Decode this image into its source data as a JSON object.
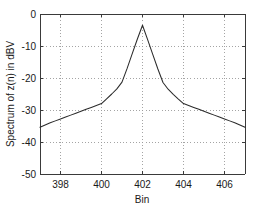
{
  "figure": {
    "background_color": "#ffffff",
    "axes_color": "#3a3a3a",
    "grid_color": "#9a9a9a",
    "curve_color": "#2b2b2b"
  },
  "chart_data": {
    "type": "line",
    "title": "",
    "xlabel": "Bin",
    "ylabel": "Spectrum of z(n) in dBV",
    "xlim": [
      397,
      407
    ],
    "ylim": [
      -50,
      0
    ],
    "xticks": [
      398,
      400,
      402,
      404,
      406
    ],
    "xtick_labels": [
      "398",
      "400",
      "402",
      "404",
      "406"
    ],
    "yticks": [
      0,
      -10,
      -20,
      -30,
      -40,
      -50
    ],
    "ytick_labels": [
      "0",
      "-10",
      "-20",
      "-30",
      "-40",
      "-50"
    ],
    "grid": true,
    "grid_style": "dotted",
    "legend": null,
    "series": [
      {
        "name": "Spectrum of z(n)",
        "x": [
          397.0,
          397.25,
          397.5,
          397.75,
          398.0,
          398.25,
          398.5,
          398.75,
          399.0,
          399.25,
          399.5,
          399.75,
          400.0,
          400.25,
          400.5,
          400.75,
          401.0,
          401.25,
          401.5,
          401.75,
          402.0,
          402.25,
          402.5,
          402.75,
          403.0,
          403.25,
          403.5,
          403.75,
          404.0,
          404.25,
          404.5,
          404.75,
          405.0,
          405.25,
          405.5,
          405.75,
          406.0,
          406.25,
          406.5,
          406.75,
          407.0
        ],
        "y": [
          -35.4,
          -34.7,
          -34.0,
          -33.4,
          -32.8,
          -32.2,
          -31.6,
          -31.0,
          -30.4,
          -29.8,
          -29.2,
          -28.6,
          -28.0,
          -26.5,
          -25.0,
          -23.4,
          -21.3,
          -17.0,
          -12.4,
          -7.8,
          -3.5,
          -8.0,
          -12.6,
          -17.2,
          -21.4,
          -23.5,
          -25.1,
          -26.6,
          -28.0,
          -28.6,
          -29.2,
          -29.8,
          -30.4,
          -31.0,
          -31.6,
          -32.2,
          -32.8,
          -33.4,
          -34.0,
          -34.7,
          -35.4
        ]
      }
    ],
    "peak": {
      "x": 402,
      "y": -3.5
    }
  },
  "axis": {
    "x_title": "Bin",
    "y_title": "Spectrum of z(n) in dBV"
  }
}
